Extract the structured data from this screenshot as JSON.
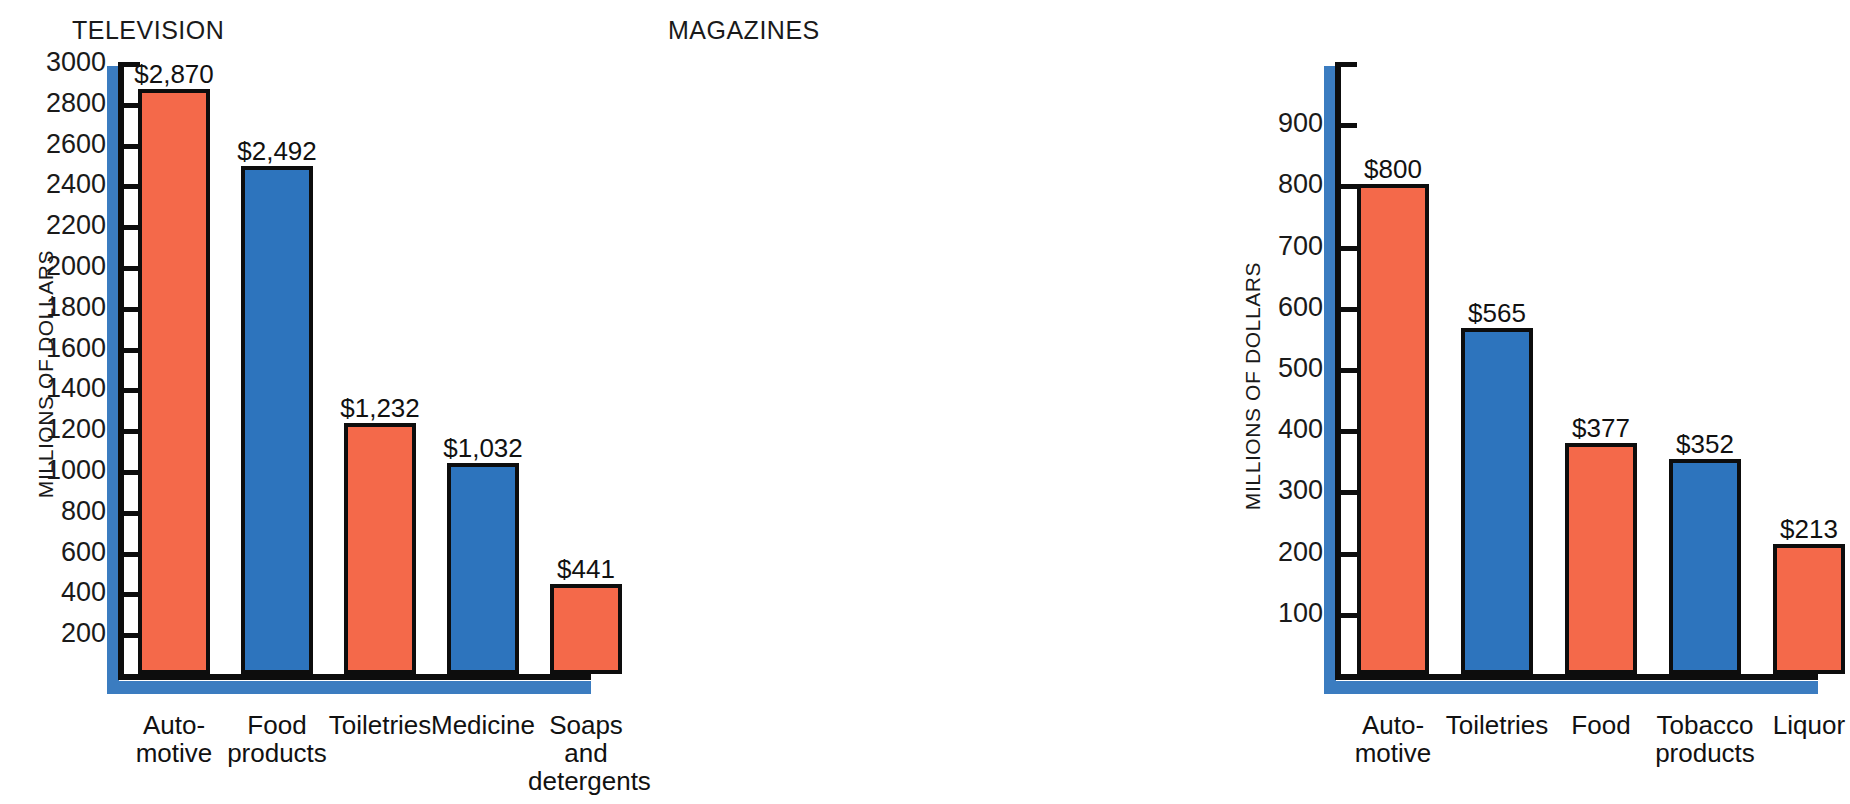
{
  "figure": {
    "background": "#ffffff",
    "orange": "#f4694a",
    "blue": "#2d74bd",
    "axis_shadow_blue": "#3b7cc0",
    "axis_black": "#0d0d0d"
  },
  "chart_data": [
    {
      "type": "bar",
      "title": "TELEVISION",
      "xlabel": "",
      "ylabel": "MILLIONS OF DOLLARS",
      "ylim": [
        0,
        3000
      ],
      "ytick_step": 200,
      "yticks": [
        200,
        400,
        600,
        800,
        1000,
        1200,
        1400,
        1600,
        1800,
        2000,
        2200,
        2400,
        2600,
        2800,
        3000
      ],
      "ytick_labels": [
        "200",
        "400",
        "600",
        "800",
        "1000",
        "1200",
        "1400",
        "1600",
        "1800",
        "2000",
        "2200",
        "2400",
        "2600",
        "2800",
        "3000"
      ],
      "grid": false,
      "legend": "none",
      "categories": [
        "Auto-\nmotive",
        "Food\nproducts",
        "Toiletries",
        "Medicine",
        "Soaps\nand\ndetergents"
      ],
      "values": [
        2870,
        2492,
        1232,
        1032,
        441
      ],
      "data_labels": [
        "$2,870",
        "$2,492",
        "$1,232",
        "$1,032",
        "$441"
      ],
      "bar_colors": [
        "#f4694a",
        "#2d74bd",
        "#f4694a",
        "#2d74bd",
        "#f4694a"
      ]
    },
    {
      "type": "bar",
      "title": "MAGAZINES",
      "xlabel": "",
      "ylabel": "MILLIONS OF DOLLARS",
      "ylim": [
        0,
        1000
      ],
      "ytick_step": 100,
      "yticks": [
        100,
        200,
        300,
        400,
        500,
        600,
        700,
        800,
        900,
        1000
      ],
      "ytick_labels": [
        "100",
        "200",
        "300",
        "400",
        "500",
        "600",
        "700",
        "800",
        "900",
        ""
      ],
      "grid": false,
      "legend": "none",
      "categories": [
        "Auto-\nmotive",
        "Toiletries",
        "Food",
        "Tobacco\nproducts",
        "Liquor"
      ],
      "values": [
        800,
        565,
        377,
        352,
        213
      ],
      "data_labels": [
        "$800",
        "$565",
        "$377",
        "$352",
        "$213"
      ],
      "bar_colors": [
        "#f4694a",
        "#2d74bd",
        "#f4694a",
        "#2d74bd",
        "#f4694a"
      ]
    }
  ]
}
